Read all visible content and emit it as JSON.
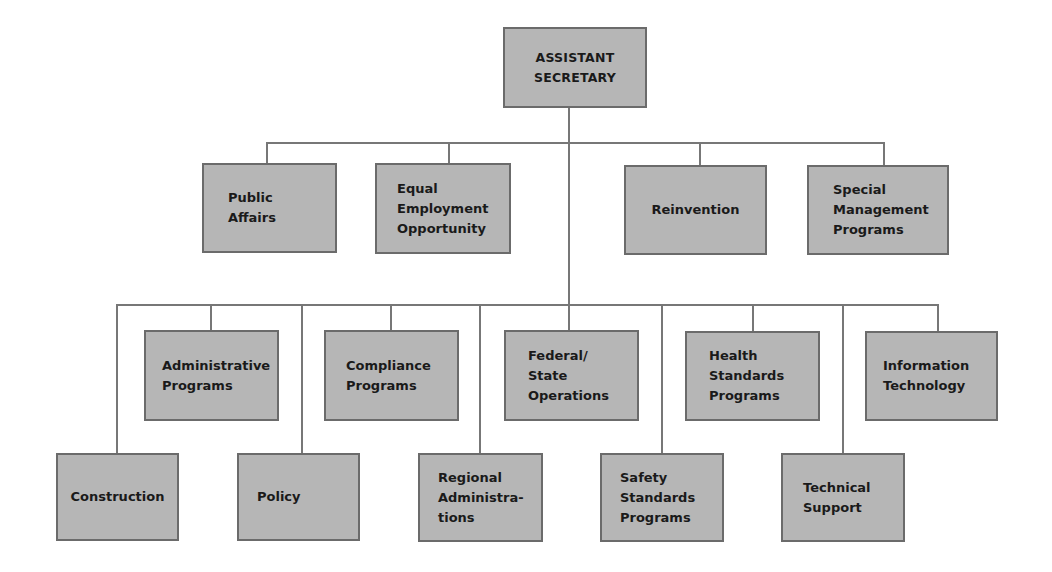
{
  "org_chart": {
    "root": {
      "label": "ASSISTANT\nSECRETARY"
    },
    "staff_offices": [
      {
        "label": "Public\nAffairs"
      },
      {
        "label": "Equal\nEmployment\nOpportunity"
      },
      {
        "label": "Reinvention"
      },
      {
        "label": "Special\nManagement\nPrograms"
      }
    ],
    "directorates_upper": [
      {
        "label": "Administrative\nPrograms"
      },
      {
        "label": "Compliance\nPrograms"
      },
      {
        "label": "Federal/\nState\nOperations"
      },
      {
        "label": "Health\nStandards\nPrograms"
      },
      {
        "label": "Information\nTechnology"
      }
    ],
    "directorates_lower": [
      {
        "label": "Construction"
      },
      {
        "label": "Policy"
      },
      {
        "label": "Regional\nAdministra-\ntions"
      },
      {
        "label": "Safety\nStandards\nPrograms"
      },
      {
        "label": "Technical\nSupport"
      }
    ]
  },
  "colors": {
    "box_fill": "#b6b6b6",
    "box_border": "#6b6b6b",
    "connector": "#777777",
    "text": "#1a1a1a"
  }
}
